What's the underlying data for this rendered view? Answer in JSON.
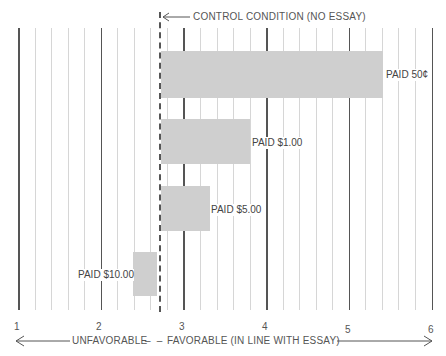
{
  "chart_data": {
    "type": "bar",
    "orientation": "horizontal",
    "title": "",
    "xlabel_left": "UNFAVORABLE",
    "xlabel_right": "FAVORABLE (IN LINE WITH ESSAY)",
    "xlim": [
      1,
      6
    ],
    "xticks": [
      "1",
      "2",
      "3",
      "4",
      "5",
      "6"
    ],
    "grid": true,
    "baseline": {
      "label": "CONTROL CONDITION (NO ESSAY)",
      "value": 2.7
    },
    "categories": [
      "PAID 50¢",
      "PAID $1.00",
      "PAID $5.00",
      "PAID $10.00"
    ],
    "values": [
      5.4,
      3.8,
      3.3,
      2.4
    ]
  },
  "labels": {
    "control": "CONTROL CONDITION (NO ESSAY)",
    "bar1": "PAID 50¢",
    "bar2": "PAID $1.00",
    "bar3": "PAID $5.00",
    "bar4": "PAID $10.00",
    "t1": "1",
    "t2": "2",
    "t3": "3",
    "t4": "4",
    "t5": "5",
    "t6": "6",
    "unfav": "UNFAVORABLE",
    "fav": "FAVORABLE (IN LINE WITH ESSAY)"
  }
}
